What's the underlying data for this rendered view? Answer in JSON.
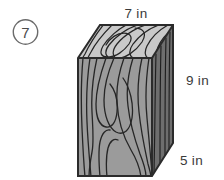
{
  "problem": {
    "number_label": "7",
    "number_icon": "circled-number"
  },
  "figure": {
    "shape_name": "rectangular-prism",
    "material": "wood",
    "labels": {
      "top_edge": "7 in",
      "right_edge": "9 in",
      "depth_edge": "5 in"
    },
    "colors": {
      "top_face": "#c9c9c9",
      "front_face": "#9b9b9b",
      "side_face": "#6e6e6e",
      "outline": "#2b2b2b",
      "grain": "#262626",
      "text": "#3a3a3a",
      "background": "#ffffff"
    },
    "dimensions": {
      "width": 7,
      "height": 9,
      "depth": 5,
      "unit": "in"
    }
  }
}
